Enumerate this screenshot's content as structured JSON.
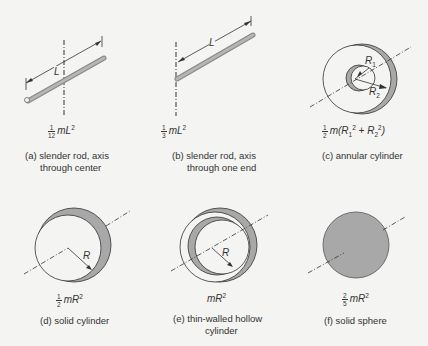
{
  "figure": {
    "panels": [
      {
        "id": "a",
        "formula_frac_num": "1",
        "formula_frac_den": "12",
        "formula_rest": "mL",
        "formula_exp": "2",
        "caption_line1": "(a)  slender rod, axis",
        "caption_line2": "through center",
        "dim_label": "L"
      },
      {
        "id": "b",
        "formula_frac_num": "1",
        "formula_frac_den": "3",
        "formula_rest": "mL",
        "formula_exp": "2",
        "caption_line1": "(b)  slender rod, axis",
        "caption_line2": "through one end",
        "dim_label": "L"
      },
      {
        "id": "c",
        "formula_frac_num": "1",
        "formula_frac_den": "2",
        "formula_rest": "m(R",
        "formula_sub1": "1",
        "formula_exp1": "2",
        "formula_mid": " + R",
        "formula_sub2": "2",
        "formula_exp2": "2",
        "formula_end": ")",
        "caption_line1": "(c)  annular cylinder",
        "dim_label_1": "R",
        "dim_label_1_sub": "1",
        "dim_label_2": "R",
        "dim_label_2_sub": "2"
      },
      {
        "id": "d",
        "formula_frac_num": "1",
        "formula_frac_den": "2",
        "formula_rest": "mR",
        "formula_exp": "2",
        "caption_line1": "(d)  solid cylinder",
        "dim_label": "R"
      },
      {
        "id": "e",
        "formula_rest": "mR",
        "formula_exp": "2",
        "caption_line1": "(e)  thin-walled hollow",
        "caption_line2": "cylinder",
        "dim_label": "R"
      },
      {
        "id": "f",
        "formula_frac_num": "2",
        "formula_frac_den": "5",
        "formula_rest": "mR",
        "formula_exp": "2",
        "caption_line1": "(f)  solid sphere"
      }
    ],
    "colors": {
      "background": "#f4f4f2",
      "fill_gray": "#a8a8a8",
      "line": "#333333"
    }
  }
}
